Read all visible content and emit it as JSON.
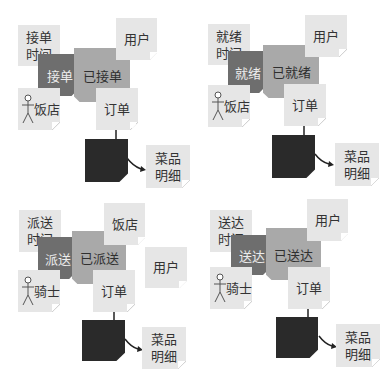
{
  "figure": {
    "panels": [
      {
        "id": "accept",
        "time_note": "接单\n时间",
        "action": "接单",
        "state": "已接单",
        "party_note": "用户",
        "actor_note": "饭店",
        "order_note": "订单",
        "detail_note": "菜品\n明细"
      },
      {
        "id": "ready",
        "time_note": "就绪\n时间",
        "action": "就绪",
        "state": "已就绪",
        "party_note": "用户",
        "actor_note": "饭店",
        "order_note": "订单",
        "detail_note": "菜品\n明细"
      },
      {
        "id": "dispatch",
        "time_note": "派送\n时间",
        "action": "派送",
        "state": "已派送",
        "party_note": "饭店",
        "extra_note": "用户",
        "actor_note": "骑士",
        "order_note": "订单",
        "detail_note": "菜品\n明细"
      },
      {
        "id": "delivered",
        "time_note": "送达\n时间",
        "action": "送达",
        "state": "已送达",
        "party_note": "用户",
        "actor_note": "骑士",
        "order_note": "订单",
        "detail_note": "菜品\n明细"
      }
    ],
    "colors": {
      "note": "#e6e6e6",
      "action": "#6e6e6e",
      "state": "#a9a9a9",
      "detail_box": "#2a2a2a"
    }
  }
}
